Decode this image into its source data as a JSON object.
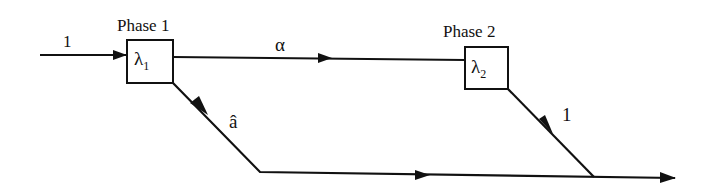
{
  "diagram": {
    "phases": [
      {
        "title": "Phase 1",
        "rate_symbol": "λ",
        "rate_subscript": "1"
      },
      {
        "title": "Phase 2",
        "rate_symbol": "λ",
        "rate_subscript": "2"
      }
    ],
    "edges": [
      {
        "from": "input",
        "to": "phase-1",
        "label": "1"
      },
      {
        "from": "phase-1",
        "to": "phase-2",
        "label": "α"
      },
      {
        "from": "phase-1",
        "to": "exit",
        "label": "â"
      },
      {
        "from": "phase-2",
        "to": "exit",
        "label": "1"
      }
    ],
    "colors": {
      "stroke": "#111111",
      "background": "#ffffff"
    }
  }
}
